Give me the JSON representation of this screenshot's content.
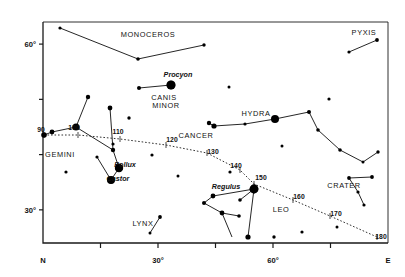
{
  "chart_data": {
    "type": "scatter",
    "title": "",
    "xlabel": "",
    "ylabel": "",
    "xlim": [
      0,
      90
    ],
    "ylim": [
      24,
      64
    ],
    "grid": false,
    "legend": "none",
    "x_axis": {
      "ticks": [
        {
          "value": 0,
          "label": "N"
        },
        {
          "value": 15,
          "label": ""
        },
        {
          "value": 30,
          "label": "30°"
        },
        {
          "value": 45,
          "label": ""
        },
        {
          "value": 60,
          "label": "60°"
        },
        {
          "value": 75,
          "label": ""
        },
        {
          "value": 90,
          "label": "E"
        }
      ]
    },
    "y_axis": {
      "ticks": [
        {
          "value": 30,
          "label": "30°"
        },
        {
          "value": 40,
          "label": ""
        },
        {
          "value": 50,
          "label": ""
        },
        {
          "value": 60,
          "label": "60°"
        }
      ]
    },
    "constellations": [
      {
        "name": "MONOCEROS",
        "label_x": 148,
        "label_y": 37
      },
      {
        "name": "PYXIS",
        "label_x": 364,
        "label_y": 35
      },
      {
        "name": "CANIS",
        "label_x": 164,
        "label_y": 100
      },
      {
        "name": "MINOR",
        "label_x": 166,
        "label_y": 108
      },
      {
        "name": "HYDRA",
        "label_x": 256,
        "label_y": 116
      },
      {
        "name": "CANCER",
        "label_x": 196,
        "label_y": 138
      },
      {
        "name": "GEMINI",
        "label_x": 60,
        "label_y": 157
      },
      {
        "name": "CRATER",
        "label_x": 344,
        "label_y": 188
      },
      {
        "name": "LEO",
        "label_x": 281,
        "label_y": 212
      },
      {
        "name": "LYNX",
        "label_x": 143,
        "label_y": 226
      }
    ],
    "named_stars": [
      {
        "name": "Procyon",
        "label_x": 178,
        "label_y": 77,
        "x": 171,
        "y": 85,
        "mag": 4.6
      },
      {
        "name": "Pollux",
        "label_x": 125,
        "label_y": 167,
        "x": 119,
        "y": 168,
        "mag": 4.2
      },
      {
        "name": "Castor",
        "label_x": 118,
        "label_y": 181,
        "x": 111,
        "y": 180,
        "mag": 4.0
      },
      {
        "name": "Regulus",
        "label_x": 226,
        "label_y": 189,
        "x": 254,
        "y": 189,
        "mag": 4.4
      }
    ],
    "ecliptic": {
      "style": "dotted",
      "points": [
        {
          "label": "90",
          "x": 44,
          "y": 135
        },
        {
          "label": "100",
          "x": 78,
          "y": 135
        },
        {
          "label": "110",
          "x": 120,
          "y": 139
        },
        {
          "label": "120",
          "x": 166,
          "y": 145
        },
        {
          "label": "130",
          "x": 207,
          "y": 153
        },
        {
          "label": "140",
          "x": 240,
          "y": 170
        },
        {
          "label": "150",
          "x": 254,
          "y": 184
        },
        {
          "label": "160",
          "x": 293,
          "y": 200
        },
        {
          "label": "170",
          "x": 330,
          "y": 216
        },
        {
          "label": "180",
          "x": 377,
          "y": 237
        }
      ],
      "label_offsets": [
        {
          "label": "90",
          "lx": 41,
          "ly": 132
        },
        {
          "label": "100",
          "lx": 74,
          "ly": 130
        },
        {
          "label": "110",
          "lx": 118,
          "ly": 134
        },
        {
          "label": "120",
          "lx": 172,
          "ly": 142
        },
        {
          "label": "130",
          "lx": 213,
          "ly": 154
        },
        {
          "label": "140",
          "lx": 236,
          "ly": 168
        },
        {
          "label": "150",
          "lx": 261,
          "ly": 180
        },
        {
          "label": "160",
          "lx": 299,
          "ly": 199
        },
        {
          "label": "170",
          "lx": 336,
          "ly": 216
        },
        {
          "label": "180",
          "lx": 381,
          "ly": 239
        }
      ]
    },
    "stars": [
      {
        "x": 60,
        "y": 28,
        "r": 1.6
      },
      {
        "x": 138,
        "y": 59,
        "r": 1.8
      },
      {
        "x": 204,
        "y": 45,
        "r": 1.7
      },
      {
        "x": 377,
        "y": 40,
        "r": 1.9
      },
      {
        "x": 349,
        "y": 52,
        "r": 1.6
      },
      {
        "x": 171,
        "y": 85,
        "r": 4.2
      },
      {
        "x": 139,
        "y": 88,
        "r": 2.0
      },
      {
        "x": 88,
        "y": 97,
        "r": 2.2
      },
      {
        "x": 229,
        "y": 87,
        "r": 1.5
      },
      {
        "x": 275,
        "y": 119,
        "r": 4.0
      },
      {
        "x": 309,
        "y": 112,
        "r": 2.0
      },
      {
        "x": 318,
        "y": 130,
        "r": 1.8
      },
      {
        "x": 245,
        "y": 124,
        "r": 1.6
      },
      {
        "x": 214,
        "y": 126,
        "r": 2.6
      },
      {
        "x": 209,
        "y": 123,
        "r": 2.2
      },
      {
        "x": 76,
        "y": 127,
        "r": 3.6
      },
      {
        "x": 44,
        "y": 135,
        "r": 2.8
      },
      {
        "x": 52,
        "y": 132,
        "r": 2.4
      },
      {
        "x": 110,
        "y": 108,
        "r": 2.4
      },
      {
        "x": 113,
        "y": 144,
        "r": 1.6
      },
      {
        "x": 129,
        "y": 118,
        "r": 1.7
      },
      {
        "x": 97,
        "y": 157,
        "r": 1.6
      },
      {
        "x": 113,
        "y": 150,
        "r": 2.2
      },
      {
        "x": 119,
        "y": 168,
        "r": 3.8
      },
      {
        "x": 111,
        "y": 180,
        "r": 3.6
      },
      {
        "x": 66,
        "y": 172,
        "r": 1.6
      },
      {
        "x": 152,
        "y": 155,
        "r": 1.6
      },
      {
        "x": 178,
        "y": 176,
        "r": 1.5
      },
      {
        "x": 230,
        "y": 172,
        "r": 1.6
      },
      {
        "x": 254,
        "y": 189,
        "r": 4.4
      },
      {
        "x": 213,
        "y": 196,
        "r": 2.4
      },
      {
        "x": 204,
        "y": 203,
        "r": 2.0
      },
      {
        "x": 222,
        "y": 213,
        "r": 2.4
      },
      {
        "x": 239,
        "y": 216,
        "r": 1.8
      },
      {
        "x": 240,
        "y": 200,
        "r": 1.8
      },
      {
        "x": 248,
        "y": 237,
        "r": 2.6
      },
      {
        "x": 274,
        "y": 237,
        "r": 1.7
      },
      {
        "x": 302,
        "y": 232,
        "r": 1.6
      },
      {
        "x": 337,
        "y": 227,
        "r": 1.5
      },
      {
        "x": 349,
        "y": 178,
        "r": 1.9
      },
      {
        "x": 372,
        "y": 177,
        "r": 1.9
      },
      {
        "x": 358,
        "y": 192,
        "r": 1.6
      },
      {
        "x": 364,
        "y": 205,
        "r": 1.6
      },
      {
        "x": 340,
        "y": 150,
        "r": 1.8
      },
      {
        "x": 378,
        "y": 152,
        "r": 1.7
      },
      {
        "x": 363,
        "y": 162,
        "r": 1.5
      },
      {
        "x": 160,
        "y": 217,
        "r": 1.9
      },
      {
        "x": 150,
        "y": 233,
        "r": 1.5
      },
      {
        "x": 282,
        "y": 146,
        "r": 1.5
      },
      {
        "x": 329,
        "y": 99,
        "r": 1.6
      }
    ],
    "lines": [
      [
        [
          60,
          28
        ],
        [
          138,
          59
        ]
      ],
      [
        [
          138,
          59
        ],
        [
          204,
          45
        ]
      ],
      [
        [
          377,
          40
        ],
        [
          349,
          52
        ]
      ],
      [
        [
          171,
          85
        ],
        [
          139,
          88
        ]
      ],
      [
        [
          88,
          97
        ],
        [
          76,
          127
        ]
      ],
      [
        [
          76,
          127
        ],
        [
          52,
          132
        ]
      ],
      [
        [
          52,
          132
        ],
        [
          44,
          135
        ]
      ],
      [
        [
          76,
          127
        ],
        [
          113,
          150
        ]
      ],
      [
        [
          113,
          150
        ],
        [
          119,
          168
        ]
      ],
      [
        [
          119,
          168
        ],
        [
          111,
          180
        ]
      ],
      [
        [
          111,
          180
        ],
        [
          97,
          157
        ]
      ],
      [
        [
          113,
          150
        ],
        [
          110,
          108
        ]
      ],
      [
        [
          275,
          119
        ],
        [
          309,
          112
        ]
      ],
      [
        [
          309,
          112
        ],
        [
          318,
          130
        ]
      ],
      [
        [
          275,
          119
        ],
        [
          245,
          124
        ]
      ],
      [
        [
          245,
          124
        ],
        [
          214,
          126
        ]
      ],
      [
        [
          214,
          126
        ],
        [
          209,
          123
        ]
      ],
      [
        [
          318,
          130
        ],
        [
          340,
          150
        ]
      ],
      [
        [
          340,
          150
        ],
        [
          363,
          162
        ]
      ],
      [
        [
          363,
          162
        ],
        [
          378,
          152
        ]
      ],
      [
        [
          254,
          189
        ],
        [
          213,
          196
        ]
      ],
      [
        [
          213,
          196
        ],
        [
          204,
          203
        ]
      ],
      [
        [
          204,
          203
        ],
        [
          222,
          213
        ]
      ],
      [
        [
          222,
          213
        ],
        [
          239,
          216
        ]
      ],
      [
        [
          254,
          189
        ],
        [
          240,
          200
        ]
      ],
      [
        [
          254,
          189
        ],
        [
          248,
          237
        ]
      ],
      [
        [
          222,
          213
        ],
        [
          232,
          237
        ]
      ],
      [
        [
          349,
          178
        ],
        [
          372,
          177
        ]
      ],
      [
        [
          349,
          178
        ],
        [
          358,
          192
        ]
      ],
      [
        [
          358,
          192
        ],
        [
          364,
          205
        ]
      ],
      [
        [
          160,
          217
        ],
        [
          150,
          233
        ]
      ]
    ]
  },
  "colors": {
    "axis": "#1a1a1a",
    "star": "#000000",
    "line": "#1a1a1a",
    "ecliptic": "#333333",
    "background": "#ffffff"
  }
}
